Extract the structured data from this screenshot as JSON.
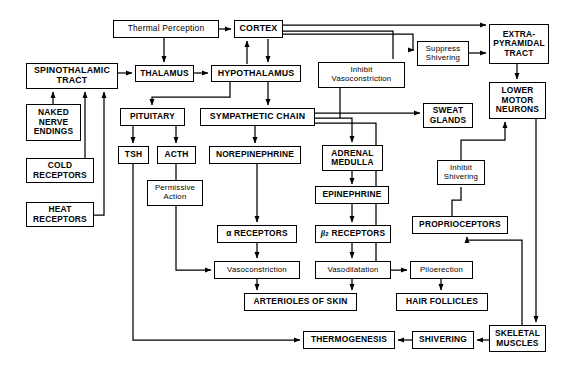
{
  "diagram": {
    "stroke_color": "#000000",
    "background_color": "#ffffff",
    "nodes": [
      {
        "id": "thermal_perception",
        "label": "Thermal Perception",
        "x": 113,
        "y": 20,
        "w": 106,
        "h": 18,
        "style": "mixed",
        "size": "s8"
      },
      {
        "id": "cortex",
        "label": "CORTEX",
        "x": 234,
        "y": 20,
        "w": 49,
        "h": 18,
        "style": "bold",
        "size": "s85"
      },
      {
        "id": "extrapyramidal_tract",
        "label": "EXTRA-\nPYRAMIDAL\nTRACT",
        "x": 489,
        "y": 24,
        "w": 60,
        "h": 40,
        "style": "bold",
        "size": "s8"
      },
      {
        "id": "spinothalamic_tract",
        "label": "SPINOTHALAMIC\nTRACT",
        "x": 26,
        "y": 63,
        "w": 92,
        "h": 26,
        "style": "bold",
        "size": "s85"
      },
      {
        "id": "thalamus",
        "label": "THALAMUS",
        "x": 135,
        "y": 65,
        "w": 59,
        "h": 17,
        "style": "bold",
        "size": "s8"
      },
      {
        "id": "hypothalamus",
        "label": "HYPOTHALAMUS",
        "x": 211,
        "y": 65,
        "w": 90,
        "h": 17,
        "style": "bold",
        "size": "s85"
      },
      {
        "id": "inhibit_vasoconstriction",
        "label": "Inhibit\nVasoconstriction",
        "x": 318,
        "y": 62,
        "w": 87,
        "h": 26,
        "style": "mixed",
        "size": "s75"
      },
      {
        "id": "suppress_shivering",
        "label": "Suppress\nShivering",
        "x": 417,
        "y": 41,
        "w": 52,
        "h": 25,
        "style": "mixed",
        "size": "s75"
      },
      {
        "id": "lower_motor_neurons",
        "label": "LOWER\nMOTOR\nNEURONS",
        "x": 489,
        "y": 82,
        "w": 57,
        "h": 37,
        "style": "bold",
        "size": "s8"
      },
      {
        "id": "pituitary",
        "label": "PITUITARY",
        "x": 120,
        "y": 108,
        "w": 65,
        "h": 18,
        "style": "bold",
        "size": "s8"
      },
      {
        "id": "sympathetic_chain",
        "label": "SYMPATHETIC CHAIN",
        "x": 200,
        "y": 108,
        "w": 115,
        "h": 18,
        "style": "bold",
        "size": "s85"
      },
      {
        "id": "sweat_glands",
        "label": "SWEAT\nGLANDS",
        "x": 423,
        "y": 103,
        "w": 50,
        "h": 25,
        "style": "bold",
        "size": "s8"
      },
      {
        "id": "tsh",
        "label": "TSH",
        "x": 118,
        "y": 146,
        "w": 31,
        "h": 18,
        "style": "bold",
        "size": "s8"
      },
      {
        "id": "acth",
        "label": "ACTH",
        "x": 157,
        "y": 146,
        "w": 39,
        "h": 18,
        "style": "bold",
        "size": "s8"
      },
      {
        "id": "norepinephrine",
        "label": "NOREPINEPHRINE",
        "x": 209,
        "y": 146,
        "w": 92,
        "h": 18,
        "style": "bold",
        "size": "s8"
      },
      {
        "id": "adrenal_medulla",
        "label": "ADRENAL\nMEDULLA",
        "x": 322,
        "y": 145,
        "w": 61,
        "h": 26,
        "style": "bold",
        "size": "s8"
      },
      {
        "id": "naked_nerve_endings",
        "label": "NAKED\nNERVE\nENDINGS",
        "x": 26,
        "y": 104,
        "w": 55,
        "h": 37,
        "style": "bold",
        "size": "s8"
      },
      {
        "id": "cold_receptors",
        "label": "COLD\nRECEPTORS",
        "x": 26,
        "y": 158,
        "w": 68,
        "h": 25,
        "style": "bold",
        "size": "s8"
      },
      {
        "id": "heat_receptors",
        "label": "HEAT\nRECEPTORS",
        "x": 26,
        "y": 202,
        "w": 68,
        "h": 25,
        "style": "bold",
        "size": "s8"
      },
      {
        "id": "permissive_action",
        "label": "Permissive\nAction",
        "x": 147,
        "y": 180,
        "w": 56,
        "h": 26,
        "style": "mixed",
        "size": "s75"
      },
      {
        "id": "inhibit_shivering",
        "label": "Inhibit\nShivering",
        "x": 437,
        "y": 160,
        "w": 48,
        "h": 25,
        "style": "mixed",
        "size": "s75"
      },
      {
        "id": "epinephrine",
        "label": "EPINEPHRINE",
        "x": 315,
        "y": 186,
        "w": 74,
        "h": 18,
        "style": "bold",
        "size": "s8"
      },
      {
        "id": "proprioceptors",
        "label": "PROPRIOCEPTORS",
        "x": 412,
        "y": 216,
        "w": 96,
        "h": 18,
        "style": "bold",
        "size": "s8"
      },
      {
        "id": "alpha_receptors",
        "label": "α RECEPTORS",
        "x": 217,
        "y": 225,
        "w": 80,
        "h": 18,
        "style": "bold",
        "size": "s8"
      },
      {
        "id": "beta2_receptors",
        "label": "",
        "html": "beta2",
        "x": 315,
        "y": 225,
        "w": 76,
        "h": 18,
        "style": "bold",
        "size": "s8"
      },
      {
        "id": "vasoconstriction",
        "label": "Vasoconstriction",
        "x": 214,
        "y": 261,
        "w": 86,
        "h": 18,
        "style": "mixed",
        "size": "s75"
      },
      {
        "id": "vasodilatation",
        "label": "Vasodilatation",
        "x": 315,
        "y": 261,
        "w": 76,
        "h": 18,
        "style": "mixed",
        "size": "s75"
      },
      {
        "id": "piloerection",
        "label": "Piloerection",
        "x": 410,
        "y": 261,
        "w": 63,
        "h": 18,
        "style": "mixed",
        "size": "s75"
      },
      {
        "id": "arterioles_of_skin",
        "label": "ARTERIOLES OF SKIN",
        "x": 244,
        "y": 293,
        "w": 113,
        "h": 18,
        "style": "bold",
        "size": "s8"
      },
      {
        "id": "hair_follicles",
        "label": "HAIR FOLLICLES",
        "x": 396,
        "y": 293,
        "w": 92,
        "h": 18,
        "style": "bold",
        "size": "s8"
      },
      {
        "id": "thermogenesis",
        "label": "THERMOGENESIS",
        "x": 303,
        "y": 331,
        "w": 92,
        "h": 18,
        "style": "bold",
        "size": "s8"
      },
      {
        "id": "shivering",
        "label": "SHIVERING",
        "x": 412,
        "y": 331,
        "w": 62,
        "h": 18,
        "style": "bold",
        "size": "s8"
      },
      {
        "id": "skeletal_muscles",
        "label": "SKELETAL\nMUSCLES",
        "x": 489,
        "y": 325,
        "w": 57,
        "h": 27,
        "style": "bold",
        "size": "s8"
      }
    ],
    "edges": [
      {
        "from": "thermal_perception",
        "to": "cortex"
      },
      {
        "from": "thermal_perception",
        "to": "thalamus"
      },
      {
        "from": "cortex",
        "to": "extrapyramidal_tract"
      },
      {
        "from": "cortex",
        "to": "inhibit_vasoconstriction"
      },
      {
        "from": "cortex",
        "to": "hypothalamus"
      },
      {
        "from": "hypothalamus",
        "to": "cortex"
      },
      {
        "from": "spinothalamic_tract",
        "to": "thalamus"
      },
      {
        "from": "thalamus",
        "to": "hypothalamus"
      },
      {
        "from": "naked_nerve_endings",
        "to": "spinothalamic_tract"
      },
      {
        "from": "cold_receptors",
        "to": "spinothalamic_tract"
      },
      {
        "from": "heat_receptors",
        "to": "spinothalamic_tract"
      },
      {
        "from": "hypothalamus",
        "to": "pituitary"
      },
      {
        "from": "hypothalamus",
        "to": "sympathetic_chain"
      },
      {
        "from": "pituitary",
        "to": "tsh"
      },
      {
        "from": "pituitary",
        "to": "acth"
      },
      {
        "from": "acth",
        "to": "permissive_action"
      },
      {
        "from": "permissive_action",
        "to": "vasoconstriction"
      },
      {
        "from": "tsh",
        "to": "thermogenesis"
      },
      {
        "from": "sympathetic_chain",
        "to": "norepinephrine"
      },
      {
        "from": "sympathetic_chain",
        "to": "adrenal_medulla"
      },
      {
        "from": "sympathetic_chain",
        "to": "sweat_glands"
      },
      {
        "from": "sympathetic_chain",
        "to": "piloerection"
      },
      {
        "from": "inhibit_vasoconstriction",
        "to": "sympathetic_chain"
      },
      {
        "from": "norepinephrine",
        "to": "alpha_receptors"
      },
      {
        "from": "adrenal_medulla",
        "to": "epinephrine"
      },
      {
        "from": "epinephrine",
        "to": "beta2_receptors"
      },
      {
        "from": "alpha_receptors",
        "to": "vasoconstriction"
      },
      {
        "from": "beta2_receptors",
        "to": "vasodilatation"
      },
      {
        "from": "vasoconstriction",
        "to": "arterioles_of_skin"
      },
      {
        "from": "vasodilatation",
        "to": "arterioles_of_skin"
      },
      {
        "from": "piloerection",
        "to": "hair_follicles"
      },
      {
        "from": "suppress_shivering",
        "to": "extrapyramidal_tract"
      },
      {
        "from": "extrapyramidal_tract",
        "to": "lower_motor_neurons"
      },
      {
        "from": "inhibit_shivering",
        "to": "lower_motor_neurons"
      },
      {
        "from": "proprioceptors",
        "to": "inhibit_shivering"
      },
      {
        "from": "skeletal_muscles",
        "to": "proprioceptors"
      },
      {
        "from": "lower_motor_neurons",
        "to": "skeletal_muscles"
      },
      {
        "from": "skeletal_muscles",
        "to": "shivering"
      },
      {
        "from": "shivering",
        "to": "thermogenesis"
      }
    ]
  }
}
